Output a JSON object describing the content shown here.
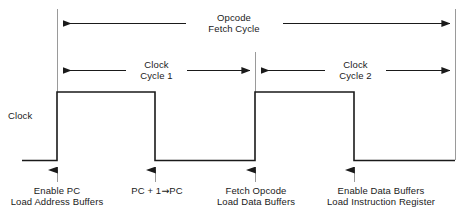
{
  "diagram": {
    "signal_label": "Clock",
    "span_top": {
      "line1": "Opcode",
      "line2": "Fetch Cycle"
    },
    "spans_mid": [
      {
        "line1": "Clock",
        "line2": "Cycle 1"
      },
      {
        "line1": "Clock",
        "line2": "Cycle 2"
      }
    ],
    "events": [
      {
        "line1": "Enable PC",
        "line2": "Load Address Buffers"
      },
      {
        "line1": "PC + 1",
        "arrow": "→",
        "line1b": "PC",
        "line2": ""
      },
      {
        "line1": "Fetch Opcode",
        "line2": "Load Data Buffers"
      },
      {
        "line1": "Enable Data Buffers",
        "line2": "Load Instruction Register"
      }
    ],
    "colors": {
      "line": "#1a1a1a",
      "text": "#1a1a1a",
      "background": "#ffffff"
    }
  }
}
